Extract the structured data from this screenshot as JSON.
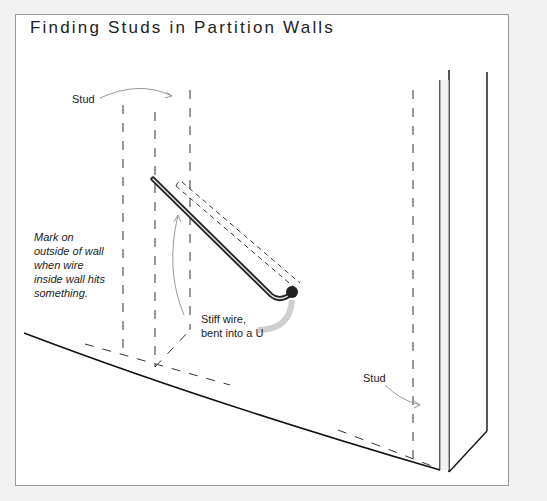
{
  "figure": {
    "title": "Finding Studs in Partition Walls",
    "labels": {
      "stud_top": "Stud",
      "stud_bottom": "Stud",
      "mark_note": [
        "Mark on",
        "outside of wall",
        "when wire",
        "inside wall hits",
        "something."
      ],
      "wire_note": [
        "Stiff wire,",
        "bent into a U"
      ]
    },
    "colors": {
      "frame_border": "#9a9a9a",
      "background": "#ffffff",
      "ink": "#222222",
      "arrow": "#999999"
    }
  }
}
